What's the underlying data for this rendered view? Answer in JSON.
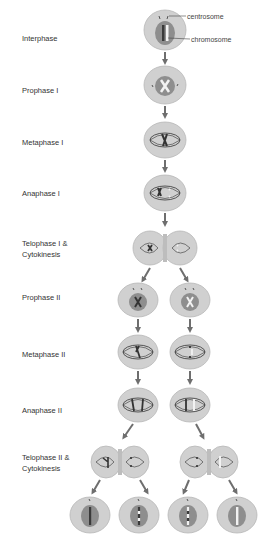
{
  "colors": {
    "cell_outer": "#d0d0d0",
    "cell_outer_stroke": "#b8b8b8",
    "nucleus": "#8e8e8e",
    "chromosome_dark": "#3a3a3a",
    "chromosome_light": "#f2f2f2",
    "arrow": "#6e6e6e",
    "label_text": "#333333"
  },
  "stages": [
    {
      "id": "interphase",
      "label": "Interphase"
    },
    {
      "id": "prophase-1",
      "label": "Prophase I"
    },
    {
      "id": "metaphase-1",
      "label": "Metaphase I"
    },
    {
      "id": "anaphase-1",
      "label": "Anaphase I"
    },
    {
      "id": "telophase-1",
      "label_line1": "Telophase I &",
      "label_line2": "Cytokinesis"
    },
    {
      "id": "prophase-2",
      "label": "Prophase II"
    },
    {
      "id": "metaphase-2",
      "label": "Metaphase II"
    },
    {
      "id": "anaphase-2",
      "label": "Anaphase II"
    },
    {
      "id": "telophase-2",
      "label_line1": "Telophase II &",
      "label_line2": "Cytokinesis"
    }
  ],
  "callouts": {
    "centrosome": "centrosome",
    "chromosome": "chromosome"
  },
  "final_cells": 4
}
